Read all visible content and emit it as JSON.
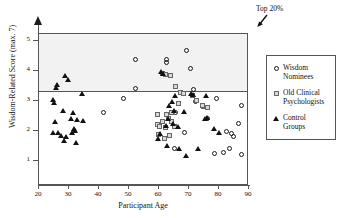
{
  "chart_data": {
    "type": "scatter",
    "title": "",
    "xlabel": "Participant Age",
    "ylabel": "Wisdom-Related Score (max. 7)",
    "xlim": [
      20,
      90
    ],
    "ylim": [
      0.15,
      5.25
    ],
    "xticks": [
      20,
      30,
      40,
      50,
      60,
      70,
      80,
      90
    ],
    "yticks": [
      1,
      2,
      3,
      4,
      5
    ],
    "grid": false,
    "legend_position": "right",
    "annotations": [
      {
        "text": "Top 20%",
        "target_note": "shaded band above threshold line"
      }
    ],
    "threshold_line": {
      "y": 3.35,
      "label": "Top 20% cutoff"
    },
    "shaded_band": {
      "from": 3.35,
      "to": 5.25,
      "color": "#f2f2f2"
    },
    "series": [
      {
        "name": "Wisdom Nominees",
        "marker": "circle",
        "color": "#1a1a1a",
        "points": [
          [
            52.0,
            4.38
          ],
          [
            52.2,
            3.42
          ],
          [
            48.2,
            3.1
          ],
          [
            41.4,
            2.62
          ],
          [
            62.6,
            4.4
          ],
          [
            62.4,
            4.3
          ],
          [
            69.0,
            4.7
          ],
          [
            70.4,
            4.08
          ],
          [
            65.6,
            2.62
          ],
          [
            71.6,
            3.4
          ],
          [
            72.0,
            3.0
          ],
          [
            74.4,
            2.82
          ],
          [
            75.8,
            2.8
          ],
          [
            79.2,
            3.1
          ],
          [
            87.6,
            2.86
          ],
          [
            86.4,
            2.26
          ],
          [
            68.6,
            1.96
          ],
          [
            65.2,
            1.42
          ],
          [
            78.6,
            1.24
          ],
          [
            81.4,
            1.26
          ],
          [
            83.4,
            1.42
          ],
          [
            87.4,
            1.22
          ],
          [
            82.6,
            1.98
          ],
          [
            84.2,
            1.92
          ],
          [
            84.8,
            1.82
          ],
          [
            76.0,
            2.4
          ]
        ]
      },
      {
        "name": "Old Clinical Psychologists",
        "marker": "square",
        "color": "#d9d9d9",
        "points": [
          [
            61.0,
            3.94
          ],
          [
            62.0,
            3.9
          ],
          [
            63.8,
            3.86
          ],
          [
            65.6,
            3.5
          ],
          [
            67.2,
            3.28
          ],
          [
            68.0,
            3.26
          ],
          [
            71.0,
            3.18
          ],
          [
            66.4,
            2.92
          ],
          [
            72.4,
            3.02
          ],
          [
            74.6,
            2.86
          ],
          [
            76.0,
            2.8
          ],
          [
            64.0,
            2.62
          ],
          [
            62.6,
            2.56
          ],
          [
            59.4,
            2.54
          ],
          [
            63.2,
            2.42
          ],
          [
            61.0,
            2.32
          ],
          [
            64.2,
            2.3
          ],
          [
            59.6,
            2.22
          ],
          [
            60.0,
            2.14
          ],
          [
            62.0,
            2.1
          ],
          [
            59.8,
            1.88
          ],
          [
            63.4,
            1.86
          ],
          [
            61.8,
            1.76
          ],
          [
            65.0,
            2.16
          ]
        ]
      },
      {
        "name": "Control Groups",
        "marker": "triangle",
        "color": "#111111",
        "points": [
          [
            28.6,
            3.86
          ],
          [
            29.8,
            3.72
          ],
          [
            26.0,
            3.56
          ],
          [
            25.6,
            3.44
          ],
          [
            34.4,
            3.24
          ],
          [
            24.8,
            3.06
          ],
          [
            25.0,
            2.96
          ],
          [
            28.0,
            2.7
          ],
          [
            31.4,
            2.6
          ],
          [
            32.6,
            2.38
          ],
          [
            34.6,
            2.36
          ],
          [
            30.8,
            2.4
          ],
          [
            25.2,
            2.32
          ],
          [
            31.6,
            2.08
          ],
          [
            32.0,
            2.02
          ],
          [
            26.4,
            1.96
          ],
          [
            24.6,
            1.94
          ],
          [
            27.4,
            1.86
          ],
          [
            29.0,
            1.82
          ],
          [
            31.0,
            1.96
          ],
          [
            28.2,
            1.66
          ],
          [
            32.4,
            1.62
          ],
          [
            60.6,
            4.0
          ],
          [
            61.2,
            3.92
          ],
          [
            65.4,
            3.2
          ],
          [
            64.2,
            3.0
          ],
          [
            63.4,
            2.84
          ],
          [
            65.0,
            2.7
          ],
          [
            68.4,
            2.66
          ],
          [
            70.6,
            3.24
          ],
          [
            71.4,
            3.22
          ],
          [
            75.6,
            3.2
          ],
          [
            76.0,
            2.46
          ],
          [
            75.2,
            2.42
          ],
          [
            78.4,
            2.08
          ],
          [
            63.0,
            2.4
          ],
          [
            64.8,
            2.24
          ],
          [
            62.2,
            2.18
          ],
          [
            60.2,
            1.92
          ],
          [
            59.8,
            1.76
          ],
          [
            62.8,
            1.5
          ],
          [
            66.8,
            1.42
          ],
          [
            69.0,
            1.16
          ],
          [
            73.0,
            1.4
          ],
          [
            80.0,
            1.96
          ],
          [
            66.2,
            2.16
          ]
        ]
      }
    ]
  },
  "legend": {
    "items": [
      {
        "label_line1": "Wisdom",
        "label_line2": "Nominees",
        "marker": "circle"
      },
      {
        "label_line1": "Old Clinical",
        "label_line2": "Psychologists",
        "marker": "square"
      },
      {
        "label_line1": "Control",
        "label_line2": "Groups",
        "marker": "triangle"
      }
    ]
  },
  "colors": {
    "axis": "#555555",
    "band": "#f2f2f2",
    "marker_outline": "#1a1a1a",
    "square_fill": "#d9d9d9"
  }
}
